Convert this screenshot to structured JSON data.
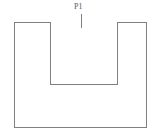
{
  "figure": {
    "kind": "line-drawing",
    "title": "",
    "background_color": "#ffffff",
    "stroke_color": "#808080",
    "stroke_width": 1,
    "canvas": {
      "width": 161,
      "height": 137
    }
  },
  "labels": [
    {
      "id": "p1",
      "text": "P1",
      "color": "#5a5a5a",
      "x": 74,
      "y": 2
    }
  ],
  "annotations": {
    "leader_line": {
      "name": "p1-leader-line",
      "x": 82,
      "y_start": 14,
      "y_end": 28,
      "color": "#808080"
    }
  },
  "shapes": {
    "outer_rectangle": {
      "name": "outer-rectangle",
      "left": 14,
      "top": 22,
      "right": 147,
      "bottom": 128,
      "width": 133,
      "height": 106
    },
    "notch": {
      "name": "top-notch",
      "left": 50,
      "right": 118,
      "top": 22,
      "bottom": 85,
      "width": 68,
      "depth": 63
    }
  },
  "outline_path": "M 14 22 L 50 22 L 50 85 L 118 85 L 118 22 L 147 22 L 147 128 L 14 128 Z"
}
